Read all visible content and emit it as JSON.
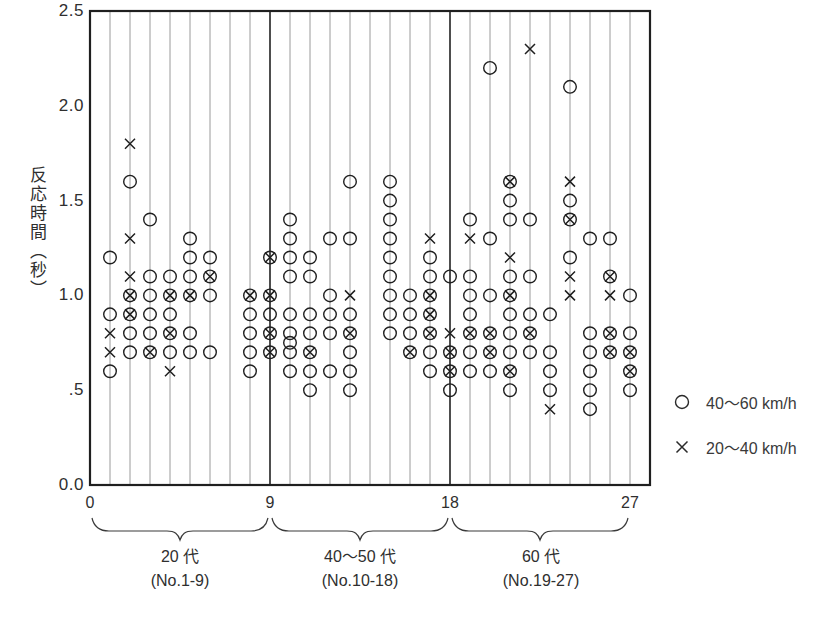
{
  "chart_data": {
    "type": "scatter",
    "title": "",
    "xlabel": "",
    "ylabel": "反応時間（秒）",
    "ylim": [
      0.0,
      2.5
    ],
    "yticks": [
      2.5,
      2.0,
      1.5,
      1.0,
      0.5,
      0.0
    ],
    "ytick_labels": [
      "2.5",
      "2.0",
      "1.5",
      "1.0",
      ".5",
      "0.0"
    ],
    "xlim": [
      0,
      28
    ],
    "xticks": [
      0,
      9,
      18,
      27
    ],
    "xtick_labels": [
      "0",
      "9",
      "18",
      "27"
    ],
    "x_gridlines_at": "integers 1 to 27, one vertical line per subject",
    "group_separators": [
      9,
      18
    ],
    "grid": true,
    "legend_position": "right-outside",
    "groups": [
      {
        "label": "20 代",
        "sublabel": "(No.1-9)",
        "range": [
          0,
          9
        ]
      },
      {
        "label": "40〜50 代",
        "sublabel": "(No.10-18)",
        "range": [
          9,
          18
        ]
      },
      {
        "label": "60 代",
        "sublabel": "(No.19-27)",
        "range": [
          18,
          27
        ]
      }
    ],
    "legend": [
      {
        "marker": "circle",
        "label": "40〜60 km/h"
      },
      {
        "marker": "cross",
        "label": "20〜40 km/h"
      }
    ],
    "colors": {
      "marks": "#1f1f1f",
      "grid": "#8f8f8f",
      "separator": "#3a3a3a",
      "axis": "#1f1f1f",
      "background": "#ffffff"
    },
    "series": [
      {
        "name": "40〜60 km/h",
        "marker": "circle",
        "points": [
          [
            1,
            1.2
          ],
          [
            1,
            0.9
          ],
          [
            1,
            0.6
          ],
          [
            2,
            1.6
          ],
          [
            2,
            1.0
          ],
          [
            2,
            0.9
          ],
          [
            2,
            0.8
          ],
          [
            2,
            0.7
          ],
          [
            3,
            1.4
          ],
          [
            3,
            1.1
          ],
          [
            3,
            1.0
          ],
          [
            3,
            0.9
          ],
          [
            3,
            0.8
          ],
          [
            3,
            0.7
          ],
          [
            4,
            1.1
          ],
          [
            4,
            1.0
          ],
          [
            4,
            0.9
          ],
          [
            4,
            0.8
          ],
          [
            4,
            0.7
          ],
          [
            5,
            1.3
          ],
          [
            5,
            1.2
          ],
          [
            5,
            1.1
          ],
          [
            5,
            1.0
          ],
          [
            5,
            0.8
          ],
          [
            5,
            0.7
          ],
          [
            6,
            1.2
          ],
          [
            6,
            1.1
          ],
          [
            6,
            1.0
          ],
          [
            6,
            0.7
          ],
          [
            8,
            1.0
          ],
          [
            8,
            0.9
          ],
          [
            8,
            0.8
          ],
          [
            8,
            0.7
          ],
          [
            8,
            0.6
          ],
          [
            9,
            1.2
          ],
          [
            9,
            1.0
          ],
          [
            9,
            0.9
          ],
          [
            9,
            0.8
          ],
          [
            9,
            0.7
          ],
          [
            10,
            1.4
          ],
          [
            10,
            1.3
          ],
          [
            10,
            1.2
          ],
          [
            10,
            1.1
          ],
          [
            10,
            0.9
          ],
          [
            10,
            0.8
          ],
          [
            10,
            0.75
          ],
          [
            10,
            0.7
          ],
          [
            10,
            0.6
          ],
          [
            11,
            1.2
          ],
          [
            11,
            1.1
          ],
          [
            11,
            0.9
          ],
          [
            11,
            0.8
          ],
          [
            11,
            0.7
          ],
          [
            11,
            0.6
          ],
          [
            11,
            0.5
          ],
          [
            12,
            1.3
          ],
          [
            12,
            1.0
          ],
          [
            12,
            0.9
          ],
          [
            12,
            0.8
          ],
          [
            12,
            0.6
          ],
          [
            13,
            1.6
          ],
          [
            13,
            1.3
          ],
          [
            13,
            0.9
          ],
          [
            13,
            0.8
          ],
          [
            13,
            0.7
          ],
          [
            13,
            0.6
          ],
          [
            13,
            0.5
          ],
          [
            15,
            1.6
          ],
          [
            15,
            1.5
          ],
          [
            15,
            1.4
          ],
          [
            15,
            1.3
          ],
          [
            15,
            1.2
          ],
          [
            15,
            1.1
          ],
          [
            15,
            1.0
          ],
          [
            15,
            0.9
          ],
          [
            15,
            0.8
          ],
          [
            16,
            1.0
          ],
          [
            16,
            0.9
          ],
          [
            16,
            0.8
          ],
          [
            16,
            0.7
          ],
          [
            17,
            1.2
          ],
          [
            17,
            1.1
          ],
          [
            17,
            1.0
          ],
          [
            17,
            0.9
          ],
          [
            17,
            0.8
          ],
          [
            17,
            0.7
          ],
          [
            17,
            0.6
          ],
          [
            18,
            1.1
          ],
          [
            18,
            0.7
          ],
          [
            18,
            0.6
          ],
          [
            18,
            0.5
          ],
          [
            19,
            1.4
          ],
          [
            19,
            1.1
          ],
          [
            19,
            1.0
          ],
          [
            19,
            0.9
          ],
          [
            19,
            0.8
          ],
          [
            19,
            0.7
          ],
          [
            19,
            0.6
          ],
          [
            20,
            2.2
          ],
          [
            20,
            1.3
          ],
          [
            20,
            1.0
          ],
          [
            20,
            0.8
          ],
          [
            20,
            0.7
          ],
          [
            20,
            0.6
          ],
          [
            21,
            1.6
          ],
          [
            21,
            1.5
          ],
          [
            21,
            1.4
          ],
          [
            21,
            1.1
          ],
          [
            21,
            1.0
          ],
          [
            21,
            0.9
          ],
          [
            21,
            0.8
          ],
          [
            21,
            0.7
          ],
          [
            21,
            0.6
          ],
          [
            21,
            0.5
          ],
          [
            22,
            1.4
          ],
          [
            22,
            1.1
          ],
          [
            22,
            0.9
          ],
          [
            22,
            0.8
          ],
          [
            22,
            0.7
          ],
          [
            23,
            0.9
          ],
          [
            23,
            0.7
          ],
          [
            23,
            0.6
          ],
          [
            23,
            0.5
          ],
          [
            24,
            2.1
          ],
          [
            24,
            1.5
          ],
          [
            24,
            1.4
          ],
          [
            24,
            1.2
          ],
          [
            25,
            1.3
          ],
          [
            25,
            0.8
          ],
          [
            25,
            0.7
          ],
          [
            25,
            0.6
          ],
          [
            25,
            0.5
          ],
          [
            25,
            0.4
          ],
          [
            26,
            1.3
          ],
          [
            26,
            1.1
          ],
          [
            26,
            0.8
          ],
          [
            26,
            0.7
          ],
          [
            27,
            1.0
          ],
          [
            27,
            0.8
          ],
          [
            27,
            0.7
          ],
          [
            27,
            0.6
          ],
          [
            27,
            0.5
          ]
        ]
      },
      {
        "name": "20〜40 km/h",
        "marker": "cross",
        "points": [
          [
            1,
            0.8
          ],
          [
            1,
            0.7
          ],
          [
            2,
            1.8
          ],
          [
            2,
            1.3
          ],
          [
            2,
            1.1
          ],
          [
            2,
            1.0
          ],
          [
            2,
            0.9
          ],
          [
            3,
            0.7
          ],
          [
            4,
            1.0
          ],
          [
            4,
            0.8
          ],
          [
            4,
            0.6
          ],
          [
            5,
            1.0
          ],
          [
            6,
            1.1
          ],
          [
            8,
            1.0
          ],
          [
            9,
            1.2
          ],
          [
            9,
            1.0
          ],
          [
            9,
            0.8
          ],
          [
            9,
            0.7
          ],
          [
            11,
            0.7
          ],
          [
            13,
            1.0
          ],
          [
            13,
            0.8
          ],
          [
            16,
            0.7
          ],
          [
            17,
            1.3
          ],
          [
            17,
            1.0
          ],
          [
            17,
            0.9
          ],
          [
            17,
            0.8
          ],
          [
            18,
            0.8
          ],
          [
            18,
            0.7
          ],
          [
            18,
            0.6
          ],
          [
            19,
            1.3
          ],
          [
            19,
            0.8
          ],
          [
            20,
            0.8
          ],
          [
            20,
            0.7
          ],
          [
            21,
            1.6
          ],
          [
            21,
            1.2
          ],
          [
            21,
            1.0
          ],
          [
            21,
            0.6
          ],
          [
            22,
            2.3
          ],
          [
            22,
            0.8
          ],
          [
            23,
            0.4
          ],
          [
            24,
            1.6
          ],
          [
            24,
            1.4
          ],
          [
            24,
            1.1
          ],
          [
            24,
            1.0
          ],
          [
            26,
            1.1
          ],
          [
            26,
            1.0
          ],
          [
            26,
            0.8
          ],
          [
            26,
            0.7
          ],
          [
            27,
            0.7
          ],
          [
            27,
            0.6
          ]
        ]
      }
    ]
  }
}
